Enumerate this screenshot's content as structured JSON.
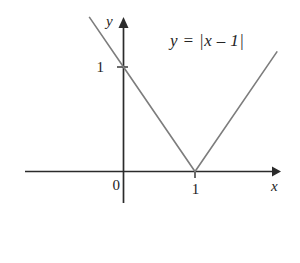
{
  "figure": {
    "background_color": "#ffffff",
    "width": 300,
    "height": 263
  },
  "equation": {
    "text": "y = |x – 1|"
  },
  "axes": {
    "x_name": "x",
    "y_name": "y",
    "origin_label": "0",
    "x_tick_label": "1",
    "y_tick_label": "1",
    "axis_color": "#2b2b2b"
  },
  "chart_data": {
    "type": "line",
    "title": "y = |x – 1|",
    "xlabel": "x",
    "ylabel": "y",
    "grid": false,
    "legend": null,
    "annotations": [
      "y = |x – 1|"
    ],
    "xticks": [
      0,
      1
    ],
    "xtick_labels": [
      "0",
      "1"
    ],
    "yticks": [
      1
    ],
    "ytick_labels": [
      "1"
    ],
    "xlim": [
      -1.35,
      2.15
    ],
    "ylim": [
      -0.45,
      2.15
    ],
    "series": [
      {
        "name": "y = |x - 1|",
        "color": "#7d7d7d",
        "line_width": 1.6,
        "x": [
          -0.48,
          0,
          1,
          2.15
        ],
        "y": [
          1.48,
          1,
          0,
          1.15
        ]
      }
    ],
    "vertex": {
      "x": 1,
      "y": 0
    },
    "y_intercept": {
      "x": 0,
      "y": 1
    }
  }
}
